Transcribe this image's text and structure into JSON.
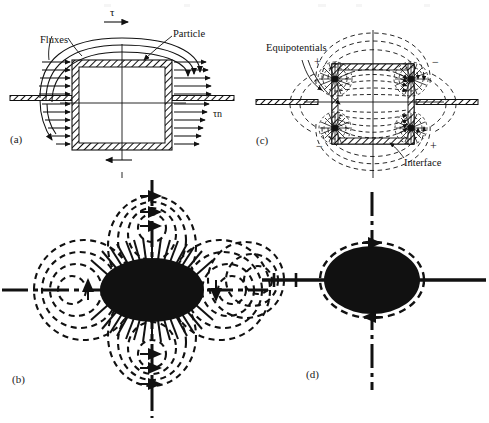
{
  "figure": {
    "background_color": "#ffffff",
    "ink_color": "#111111",
    "panels": [
      {
        "id": "a",
        "label": "(a)",
        "kind": "schematic",
        "description": "Square particle with hatched shell straddling a hatched horizontal interface; parallel heat-flux arrows converge on the particle from both sides and curved flux lines bend over the top.",
        "annotations": [
          {
            "name": "fluxes-label",
            "text": "Fluxes"
          },
          {
            "name": "particle-label",
            "text": "Particle"
          },
          {
            "name": "tau-top-label",
            "text": "τ"
          },
          {
            "name": "tau-n-label",
            "text": "τn"
          }
        ]
      },
      {
        "id": "b",
        "label": "(b)",
        "kind": "field-map",
        "description": "Quadrupolar dashed flux-line pattern around a solid black ellipse, with four lobes (top, bottom, left, right) and solid dash-dot axes through the centre."
      },
      {
        "id": "c",
        "label": "(c)",
        "kind": "schematic",
        "description": "Square particle with hatched shell on a hatched interface; dashed equipotential contours loop around four corner charge concentrations labelled with alternating plus and minus signs.",
        "annotations": [
          {
            "name": "equipotentials-label",
            "text": "Equipotentials"
          },
          {
            "name": "interface-label",
            "text": "Interface"
          }
        ],
        "charge_signs": [
          {
            "name": "sign-top-left",
            "text": "+"
          },
          {
            "name": "sign-top-right",
            "text": "−"
          },
          {
            "name": "sign-bottom-left",
            "text": "−"
          },
          {
            "name": "sign-bottom-right",
            "text": "+"
          }
        ]
      },
      {
        "id": "d",
        "label": "(d)",
        "kind": "field-map",
        "description": "Solid black ellipse enclosed by a single dashed contour, with solid horizontal axis and dash-dot vertical axis; a small residual set of dashed contours appears at the far left."
      }
    ]
  }
}
